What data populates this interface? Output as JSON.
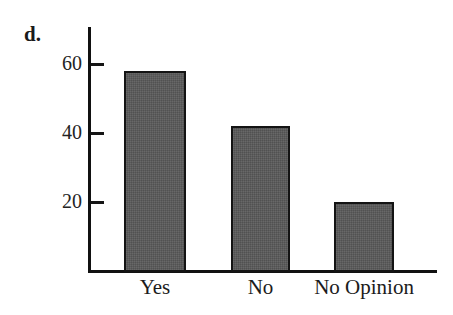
{
  "figure": {
    "panel_label": "d.",
    "background_color": "#ffffff"
  },
  "chart_data": {
    "type": "bar",
    "title": "",
    "subtitle": "",
    "xlabel": "",
    "ylabel": "",
    "categories": [
      "Yes",
      "No",
      "No Opinion"
    ],
    "values": [
      58,
      42,
      20
    ],
    "ylim": [
      0,
      70
    ],
    "yticks": [
      20,
      40,
      60
    ],
    "ytick_labels": [
      "20",
      "40",
      "60"
    ],
    "grid": false,
    "legend": null,
    "legend_position": "none",
    "bar_fill_color": "#595959",
    "bar_edge_color": "#141414",
    "axis_color": "#111111",
    "annotations": []
  }
}
